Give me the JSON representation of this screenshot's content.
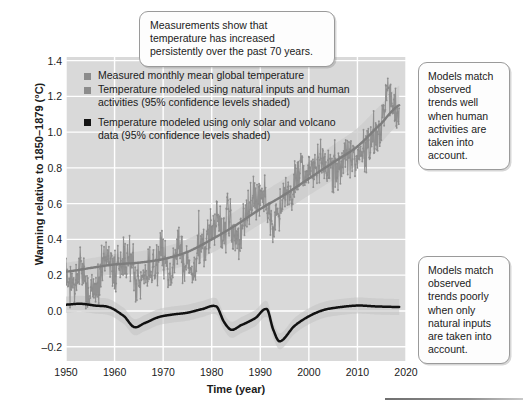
{
  "chart_data": {
    "type": "line",
    "title": "",
    "xlabel": "Time (year)",
    "ylabel": "Warming relative to 1850–1879 (°C)",
    "xlim": [
      1950,
      2020
    ],
    "ylim": [
      -0.28,
      1.42
    ],
    "xticks": [
      1950,
      1960,
      1970,
      1980,
      1990,
      2000,
      2010,
      2020
    ],
    "yticks": [
      -0.2,
      0.0,
      0.2,
      0.4,
      0.6,
      0.8,
      1.0,
      1.2,
      1.4
    ],
    "grid": true,
    "legend_position": "upper-left-inside",
    "plot_background": "#d9d9d9",
    "gridline_color": "#ffffff",
    "series": [
      {
        "name": "Measured monthly mean global temperature",
        "style": "noisy-line-with-markers",
        "color": "#8c8c8c",
        "x_start": 1950,
        "x_end": 2018.6,
        "monthly_values_by_year": [
          0.19,
          0.13,
          0.21,
          0.28,
          0.14,
          0.15,
          0.1,
          0.24,
          0.29,
          0.26,
          0.24,
          0.3,
          0.27,
          0.3,
          0.13,
          0.17,
          0.22,
          0.24,
          0.2,
          0.33,
          0.3,
          0.2,
          0.28,
          0.41,
          0.22,
          0.26,
          0.17,
          0.41,
          0.36,
          0.42,
          0.48,
          0.5,
          0.41,
          0.58,
          0.4,
          0.4,
          0.46,
          0.58,
          0.62,
          0.6,
          0.63,
          0.61,
          0.47,
          0.52,
          0.57,
          0.67,
          0.6,
          0.75,
          0.83,
          0.73,
          0.78,
          0.82,
          0.8,
          0.84,
          0.79,
          0.8,
          0.78,
          0.88,
          0.85,
          0.9,
          0.86,
          0.88,
          0.9,
          1.0,
          0.94,
          1.13,
          1.23,
          1.14,
          1.08
        ],
        "noise_amplitude_c": 0.18,
        "note": "Monthly resolution; annual means listed above, each year scatters about +/-0.18 C"
      },
      {
        "name": "Temperature modeled using natural inputs and human activities (95% confidence levels shaded)",
        "style": "smooth-line-with-shaded-band",
        "color": "#8c8c8c",
        "band_color": "#cbcbcb",
        "band_half_width_c": 0.11,
        "x": [
          1950,
          1955,
          1960,
          1965,
          1970,
          1975,
          1980,
          1985,
          1990,
          1995,
          2000,
          2005,
          2010,
          2015,
          2018.6
        ],
        "values": [
          0.22,
          0.24,
          0.26,
          0.27,
          0.29,
          0.33,
          0.4,
          0.48,
          0.57,
          0.65,
          0.74,
          0.83,
          0.92,
          1.05,
          1.15
        ]
      },
      {
        "name": "Temperature modeled using only solar and volcano data (95% confidence levels shaded)",
        "style": "smooth-line-with-shaded-band",
        "color": "#111111",
        "band_color": "#c2c2c2",
        "band_half_width_c": 0.045,
        "x": [
          1950,
          1953,
          1956,
          1959,
          1962,
          1964,
          1966,
          1969,
          1972,
          1975,
          1978,
          1981,
          1982.5,
          1984,
          1986,
          1989,
          1991.4,
          1992.6,
          1994,
          1997,
          2000,
          2003,
          2006,
          2010,
          2014,
          2018.6
        ],
        "values": [
          0.035,
          0.04,
          0.03,
          0.02,
          -0.03,
          -0.09,
          -0.07,
          -0.035,
          -0.02,
          -0.01,
          0.01,
          0.025,
          -0.06,
          -0.105,
          -0.08,
          -0.04,
          0.01,
          -0.1,
          -0.17,
          -0.085,
          -0.03,
          0.005,
          0.02,
          0.03,
          0.025,
          0.022
        ],
        "annotations": [
          "volcanic cooling dip near 1963 (Agung)",
          "volcanic cooling dip near 1983 (El Chichón)",
          "volcanic cooling dip near 1992 (Pinatubo)"
        ]
      }
    ]
  },
  "legend": {
    "items": [
      {
        "label": "Measured monthly mean global temperature",
        "swatch_color": "#8c8c8c"
      },
      {
        "label": "Temperature modeled using natural inputs and human activities (95% confidence levels shaded)",
        "swatch_color": "#8c8c8c"
      },
      {
        "label": "Temperature modeled using only solar and volcano data (95% confidence levels shaded)",
        "swatch_color": "#141414"
      }
    ]
  },
  "callouts": {
    "top": "Measurements show that temperature has increased persistently over the past 70 years.",
    "right_top": "Models match observed trends well when human activities are taken into account.",
    "right_bottom": "Models match observed trends poorly when only natural inputs are taken into account."
  }
}
